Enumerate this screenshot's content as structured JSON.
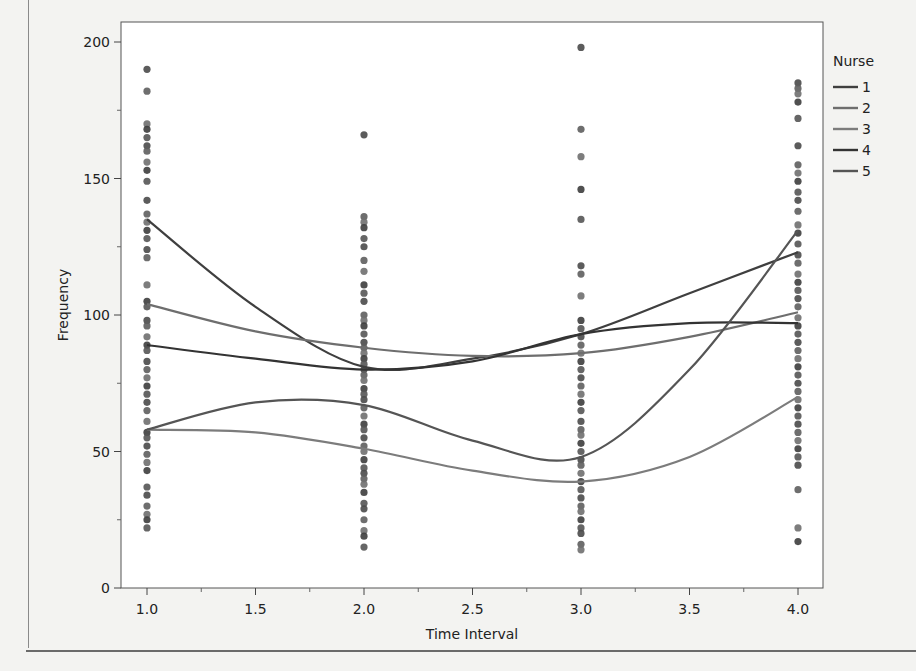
{
  "chart_data": {
    "type": "scatter",
    "title": "",
    "xlabel": "Time Interval",
    "ylabel": "Frequency",
    "xlim": [
      0.88,
      4.12
    ],
    "ylim": [
      0,
      207
    ],
    "x_ticks": [
      1.0,
      1.5,
      2.0,
      2.5,
      3.0,
      3.5,
      4.0
    ],
    "x_tick_labels": [
      "1.0",
      "1.5",
      "2.0",
      "2.5",
      "3.0",
      "3.5",
      "4.0"
    ],
    "x_minor_ticks": [
      1.25,
      1.75,
      2.25,
      2.75,
      3.25,
      3.75
    ],
    "y_ticks": [
      0,
      50,
      100,
      150,
      200
    ],
    "y_tick_labels": [
      "0",
      "50",
      "100",
      "150",
      "200"
    ],
    "y_minor_ticks": [
      25,
      75,
      125,
      175
    ],
    "grid": false,
    "legend": {
      "title": "Nurse",
      "position": "right",
      "entries": [
        "1",
        "2",
        "3",
        "4",
        "5"
      ]
    },
    "points": [
      {
        "x": 1.0,
        "values": [
          190,
          182,
          170,
          168,
          165,
          162,
          160,
          156,
          153,
          149,
          142,
          137,
          134,
          131,
          128,
          124,
          121,
          111,
          105,
          103,
          98,
          96,
          92,
          89,
          87,
          83,
          80,
          77,
          74,
          71,
          68,
          65,
          61,
          57,
          55,
          52,
          49,
          46,
          43,
          37,
          34,
          30,
          27,
          25,
          22
        ]
      },
      {
        "x": 2.0,
        "values": [
          166,
          136,
          134,
          132,
          128,
          125,
          120,
          116,
          111,
          108,
          105,
          100,
          98,
          96,
          93,
          90,
          88,
          86,
          84,
          82,
          80,
          78,
          76,
          73,
          71,
          69,
          66,
          63,
          60,
          58,
          55,
          52,
          50,
          47,
          44,
          42,
          40,
          38,
          35,
          31,
          29,
          25,
          21,
          19,
          15
        ]
      },
      {
        "x": 3.0,
        "values": [
          198,
          168,
          158,
          146,
          135,
          118,
          115,
          107,
          98,
          95,
          92,
          89,
          86,
          83,
          80,
          77,
          74,
          71,
          68,
          65,
          61,
          58,
          56,
          53,
          50,
          47,
          45,
          42,
          39,
          36,
          33,
          30,
          28,
          25,
          22,
          20,
          16,
          14
        ]
      },
      {
        "x": 4.0,
        "values": [
          185,
          183,
          181,
          178,
          172,
          162,
          155,
          152,
          149,
          145,
          142,
          138,
          133,
          130,
          126,
          122,
          119,
          115,
          112,
          109,
          106,
          103,
          99,
          96,
          93,
          90,
          87,
          84,
          81,
          78,
          75,
          72,
          69,
          66,
          63,
          60,
          57,
          54,
          51,
          48,
          45,
          36,
          22,
          17
        ]
      }
    ],
    "series": [
      {
        "name": "1",
        "x": [
          1.0,
          1.5,
          2.0,
          2.5,
          3.0,
          3.5,
          4.0
        ],
        "values": [
          135,
          103,
          81,
          84,
          93,
          108,
          123
        ],
        "color": "#3f3f3f"
      },
      {
        "name": "2",
        "x": [
          1.0,
          1.5,
          2.0,
          2.5,
          3.0,
          3.5,
          4.0
        ],
        "values": [
          104,
          94,
          88,
          85,
          86,
          92,
          101
        ],
        "color": "#6e6e6e"
      },
      {
        "name": "3",
        "x": [
          1.0,
          1.5,
          2.0,
          2.5,
          3.0,
          3.5,
          4.0
        ],
        "values": [
          58,
          57,
          51,
          43,
          39,
          48,
          70
        ],
        "color": "#7c7c7c"
      },
      {
        "name": "4",
        "x": [
          1.0,
          1.5,
          2.0,
          2.5,
          3.0,
          3.5,
          4.0
        ],
        "values": [
          89,
          84,
          80,
          83,
          93,
          97,
          97
        ],
        "color": "#333333"
      },
      {
        "name": "5",
        "x": [
          1.0,
          1.5,
          2.0,
          2.5,
          3.0,
          3.5,
          4.0
        ],
        "values": [
          58,
          68,
          67,
          54,
          48,
          80,
          131
        ],
        "color": "#555555"
      }
    ]
  }
}
